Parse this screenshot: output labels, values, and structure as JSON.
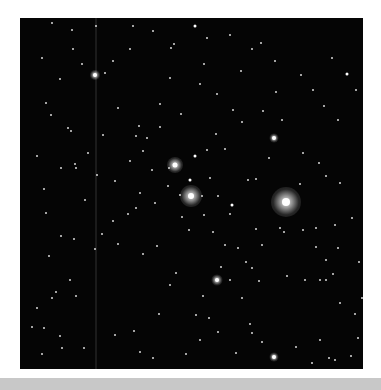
{
  "image": {
    "subject": "open star cluster field",
    "background_color": "#050505",
    "frame": {
      "x": 20,
      "y": 18,
      "width": 343,
      "height": 351
    },
    "bottom_strip_color": "#c8c8c8"
  },
  "bright_stars": [
    {
      "x": 155,
      "y": 147,
      "glow": 16,
      "core": 5
    },
    {
      "x": 171,
      "y": 178,
      "glow": 22,
      "core": 6
    },
    {
      "x": 266,
      "y": 184,
      "glow": 30,
      "core": 8
    },
    {
      "x": 75,
      "y": 57,
      "glow": 10,
      "core": 4
    },
    {
      "x": 197,
      "y": 262,
      "glow": 11,
      "core": 4
    },
    {
      "x": 254,
      "y": 120,
      "glow": 9,
      "core": 4
    },
    {
      "x": 254,
      "y": 339,
      "glow": 9,
      "core": 4
    }
  ],
  "stars": [
    [
      22,
      40,
      2
    ],
    [
      32,
      5,
      2
    ],
    [
      52,
      12,
      2
    ],
    [
      62,
      46,
      2
    ],
    [
      26,
      85,
      2
    ],
    [
      48,
      110,
      2
    ],
    [
      51,
      113,
      2
    ],
    [
      56,
      150,
      2
    ],
    [
      83,
      117,
      2
    ],
    [
      127,
      120,
      2
    ],
    [
      140,
      109,
      2
    ],
    [
      161,
      96,
      2
    ],
    [
      175,
      138,
      3
    ],
    [
      170,
      162,
      3
    ],
    [
      190,
      160,
      2
    ],
    [
      182,
      178,
      2
    ],
    [
      198,
      178,
      2
    ],
    [
      212,
      187,
      3
    ],
    [
      210,
      196,
      2
    ],
    [
      228,
      162,
      2
    ],
    [
      236,
      161,
      2
    ],
    [
      280,
      166,
      2
    ],
    [
      249,
      140,
      2
    ],
    [
      262,
      102,
      2
    ],
    [
      243,
      93,
      2
    ],
    [
      256,
      74,
      2
    ],
    [
      221,
      53,
      2
    ],
    [
      255,
      43,
      2
    ],
    [
      241,
      25,
      2
    ],
    [
      281,
      57,
      2
    ],
    [
      312,
      40,
      2
    ],
    [
      327,
      56,
      3
    ],
    [
      336,
      72,
      2
    ],
    [
      320,
      165,
      2
    ],
    [
      315,
      207,
      2
    ],
    [
      306,
      158,
      2
    ],
    [
      283,
      135,
      2
    ],
    [
      299,
      145,
      2
    ],
    [
      304,
      88,
      2
    ],
    [
      293,
      72,
      2
    ],
    [
      232,
      31,
      2
    ],
    [
      210,
      17,
      2
    ],
    [
      175,
      8,
      3
    ],
    [
      187,
      20,
      2
    ],
    [
      154,
      26,
      2
    ],
    [
      133,
      13,
      2
    ],
    [
      110,
      31,
      2
    ],
    [
      93,
      43,
      2
    ],
    [
      76,
      8,
      2
    ],
    [
      53,
      31,
      2
    ],
    [
      40,
      61,
      2
    ],
    [
      31,
      97,
      2
    ],
    [
      17,
      138,
      2
    ],
    [
      24,
      171,
      2
    ],
    [
      41,
      150,
      2
    ],
    [
      55,
      146,
      2
    ],
    [
      77,
      157,
      2
    ],
    [
      95,
      163,
      2
    ],
    [
      110,
      143,
      2
    ],
    [
      119,
      108,
      2
    ],
    [
      116,
      118,
      2
    ],
    [
      140,
      86,
      2
    ],
    [
      123,
      133,
      2
    ],
    [
      132,
      152,
      2
    ],
    [
      148,
      168,
      2
    ],
    [
      160,
      177,
      2
    ],
    [
      162,
      199,
      2
    ],
    [
      169,
      212,
      2
    ],
    [
      184,
      197,
      2
    ],
    [
      193,
      214,
      2
    ],
    [
      205,
      227,
      2
    ],
    [
      201,
      249,
      2
    ],
    [
      218,
      230,
      2
    ],
    [
      226,
      244,
      2
    ],
    [
      232,
      250,
      2
    ],
    [
      236,
      211,
      2
    ],
    [
      242,
      227,
      2
    ],
    [
      260,
      210,
      2
    ],
    [
      264,
      214,
      2
    ],
    [
      283,
      212,
      2
    ],
    [
      296,
      229,
      2
    ],
    [
      306,
      242,
      2
    ],
    [
      318,
      230,
      2
    ],
    [
      300,
      262,
      2
    ],
    [
      306,
      262,
      2
    ],
    [
      313,
      256,
      2
    ],
    [
      285,
      262,
      2
    ],
    [
      267,
      258,
      2
    ],
    [
      239,
      263,
      2
    ],
    [
      210,
      262,
      2
    ],
    [
      222,
      280,
      2
    ],
    [
      183,
      278,
      2
    ],
    [
      150,
      267,
      2
    ],
    [
      156,
      255,
      2
    ],
    [
      139,
      296,
      2
    ],
    [
      176,
      297,
      2
    ],
    [
      189,
      300,
      2
    ],
    [
      198,
      314,
      2
    ],
    [
      232,
      315,
      2
    ],
    [
      242,
      324,
      2
    ],
    [
      276,
      329,
      2
    ],
    [
      300,
      322,
      2
    ],
    [
      292,
      345,
      2
    ],
    [
      315,
      342,
      2
    ],
    [
      309,
      340,
      2
    ],
    [
      331,
      338,
      2
    ],
    [
      338,
      320,
      2
    ],
    [
      335,
      296,
      2
    ],
    [
      320,
      285,
      2
    ],
    [
      137,
      228,
      2
    ],
    [
      123,
      236,
      2
    ],
    [
      98,
      226,
      2
    ],
    [
      75,
      231,
      2
    ],
    [
      82,
      216,
      2
    ],
    [
      54,
      221,
      2
    ],
    [
      41,
      218,
      2
    ],
    [
      29,
      238,
      2
    ],
    [
      36,
      274,
      2
    ],
    [
      32,
      280,
      2
    ],
    [
      50,
      262,
      2
    ],
    [
      56,
      278,
      2
    ],
    [
      17,
      290,
      2
    ],
    [
      12,
      309,
      2
    ],
    [
      24,
      310,
      2
    ],
    [
      40,
      318,
      2
    ],
    [
      42,
      330,
      2
    ],
    [
      22,
      336,
      2
    ],
    [
      64,
      330,
      2
    ],
    [
      95,
      317,
      2
    ],
    [
      114,
      313,
      2
    ],
    [
      120,
      334,
      2
    ],
    [
      133,
      340,
      2
    ],
    [
      166,
      336,
      2
    ],
    [
      180,
      322,
      2
    ],
    [
      216,
      335,
      2
    ],
    [
      230,
      306,
      2
    ],
    [
      93,
      203,
      2
    ],
    [
      108,
      196,
      2
    ],
    [
      116,
      190,
      2
    ],
    [
      120,
      175,
      2
    ],
    [
      135,
      185,
      2
    ],
    [
      149,
      150,
      2
    ],
    [
      196,
      116,
      2
    ],
    [
      213,
      92,
      2
    ],
    [
      205,
      131,
      2
    ],
    [
      187,
      132,
      2
    ],
    [
      151,
      30,
      2
    ],
    [
      180,
      66,
      2
    ],
    [
      197,
      76,
      2
    ],
    [
      222,
      104,
      2
    ],
    [
      296,
      210,
      2
    ],
    [
      318,
      102,
      2
    ],
    [
      332,
      200,
      2
    ],
    [
      339,
      244,
      2
    ],
    [
      342,
      280,
      2
    ],
    [
      113,
      8,
      2
    ],
    [
      85,
      55,
      2
    ],
    [
      26,
      195,
      2
    ],
    [
      65,
      182,
      2
    ],
    [
      68,
      135,
      2
    ],
    [
      98,
      90,
      2
    ],
    [
      150,
      60,
      2
    ],
    [
      184,
      46,
      2
    ]
  ],
  "bottom_strip": {
    "visible": true
  }
}
